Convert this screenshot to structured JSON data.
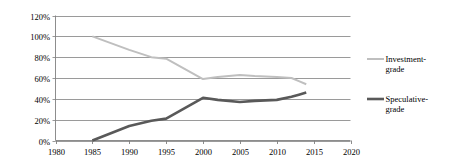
{
  "chart_data": {
    "type": "line",
    "title": "",
    "subtitle": "",
    "xlabel": "",
    "ylabel": "",
    "xlim": [
      1980,
      2020
    ],
    "ylim": [
      0,
      120
    ],
    "grid": "horizontal",
    "legend_position": "right",
    "x_ticks": [
      "1980",
      "1985",
      "1990",
      "1995",
      "2000",
      "2005",
      "2010",
      "2015",
      "2020"
    ],
    "x_tick_values": [
      1980,
      1985,
      1990,
      1995,
      2000,
      2005,
      2010,
      2015,
      2020
    ],
    "y_ticks": [
      "0%",
      "20%",
      "40%",
      "60%",
      "80%",
      "100%",
      "120%"
    ],
    "y_tick_values": [
      0,
      20,
      40,
      60,
      80,
      100,
      120
    ],
    "series": [
      {
        "name": "Investment-grade",
        "legend_line1": "Investment-",
        "legend_line2": "grade",
        "color": "#bfbfbf",
        "stroke_width": 2.0,
        "x": [
          1985,
          1990,
          1993,
          1995,
          2000,
          2002,
          2005,
          2007,
          2010,
          2012,
          2013,
          2014
        ],
        "values": [
          100,
          87,
          80,
          78.5,
          59,
          61,
          63,
          62,
          61,
          60,
          57,
          54
        ]
      },
      {
        "name": "Speculative-grade",
        "legend_line1": "Speculative-",
        "legend_line2": "grade",
        "color": "#595959",
        "stroke_width": 2.6,
        "x": [
          1985,
          1990,
          1993,
          1995,
          2000,
          2002,
          2005,
          2007,
          2010,
          2012,
          2013,
          2014
        ],
        "values": [
          0,
          14,
          19,
          21,
          41,
          39,
          37,
          38,
          39,
          42,
          44,
          46
        ]
      }
    ],
    "axis_color": "#808080",
    "gridline_color": "#808080",
    "background_color": "#ffffff"
  },
  "legend": {
    "items": [
      {
        "line1": "Investment-",
        "line2": "grade",
        "color": "#bfbfbf"
      },
      {
        "line1": "Speculative-",
        "line2": "grade",
        "color": "#595959"
      }
    ]
  }
}
